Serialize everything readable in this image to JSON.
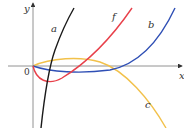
{
  "figure": {
    "axes": {
      "x_label": "x",
      "y_label": "y",
      "origin_label": "0"
    },
    "curves": [
      {
        "id": "a",
        "label": "a",
        "color": "#1a1a1a"
      },
      {
        "id": "f",
        "label": "f",
        "color": "#e8404a"
      },
      {
        "id": "b",
        "label": "b",
        "color": "#2f4fb5"
      },
      {
        "id": "c",
        "label": "c",
        "color": "#f2c14a"
      }
    ]
  }
}
